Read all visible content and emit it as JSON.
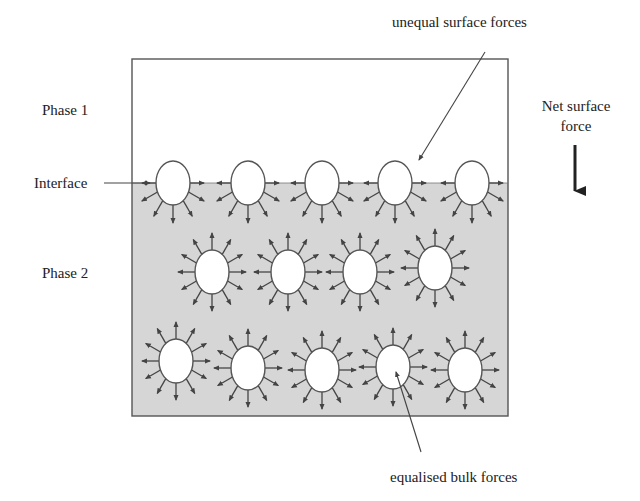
{
  "diagram": {
    "title": "",
    "colors": {
      "background": "#ffffff",
      "phase2_fill": "#d6d6d6",
      "border": "#555555",
      "arrow": "#444444",
      "molecule_fill": "#ffffff",
      "text": "#222222"
    },
    "container": {
      "x": 132,
      "y": 59,
      "width": 376,
      "height": 357,
      "interface_y": 183
    },
    "labels": {
      "phase1": "Phase 1",
      "phase2": "Phase 2",
      "interface": "Interface",
      "unequal": "unequal surface forces",
      "net_line1": "Net surface",
      "net_line2": "force",
      "equalised": "equalised bulk forces"
    },
    "surface_molecules": [
      {
        "x": 173,
        "y": 183
      },
      {
        "x": 248,
        "y": 183
      },
      {
        "x": 322,
        "y": 183
      },
      {
        "x": 395,
        "y": 183
      },
      {
        "x": 472,
        "y": 183
      }
    ],
    "bulk_molecules": [
      {
        "x": 212,
        "y": 272
      },
      {
        "x": 288,
        "y": 272
      },
      {
        "x": 360,
        "y": 272
      },
      {
        "x": 435,
        "y": 268
      },
      {
        "x": 176,
        "y": 361
      },
      {
        "x": 248,
        "y": 368
      },
      {
        "x": 322,
        "y": 370
      },
      {
        "x": 393,
        "y": 367
      },
      {
        "x": 465,
        "y": 370
      }
    ],
    "molecule_radius": {
      "rx": 17,
      "ry": 22
    }
  }
}
